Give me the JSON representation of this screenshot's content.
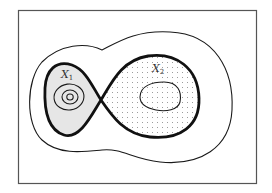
{
  "diagram": {
    "type": "phase-portrait figure-eight separatrix",
    "colors": {
      "background": "#ffffff",
      "stroke": "#1a1a1a",
      "left_fill": "#e6e6e6",
      "dots": "#8a8a8a",
      "frame": "#555555"
    },
    "labels": {
      "x1": {
        "base": "X",
        "sub": "1"
      },
      "x2": {
        "base": "X",
        "sub": "2"
      }
    },
    "elements": [
      "outer-frame",
      "outer-contour",
      "separatrix-figure-eight",
      "left-lobe-shaded",
      "right-lobe-dotted",
      "left-nested-ovals-3",
      "right-inner-oval"
    ]
  }
}
